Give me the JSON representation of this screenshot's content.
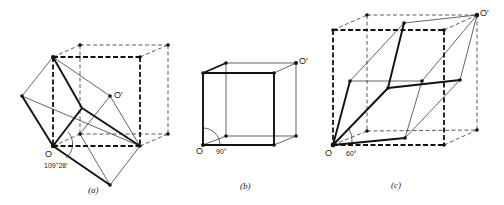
{
  "figure": {
    "panels": [
      {
        "id": "a",
        "caption": "(a)",
        "origin_label": "O",
        "target_label": "O′",
        "angle_label": "109°28′"
      },
      {
        "id": "b",
        "caption": "(b)",
        "origin_label": "O",
        "target_label": "O′",
        "angle_label": "90°"
      },
      {
        "id": "c",
        "caption": "(c)",
        "origin_label": "O",
        "target_label": "O′",
        "angle_label": "60°"
      }
    ]
  }
}
